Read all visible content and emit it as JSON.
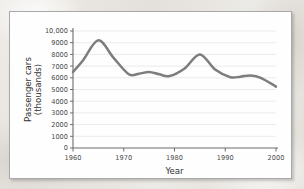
{
  "chart_data": {
    "type": "line",
    "title": "",
    "xlabel": "Year",
    "ylabel": "Passenger cars (thousands)",
    "ylabel_line1": "Passenger cars",
    "ylabel_line2": "(thousands)",
    "xlim": [
      1960,
      2000
    ],
    "ylim": [
      0,
      10000
    ],
    "grid": true,
    "legend": "none",
    "xticks": [
      1960,
      1970,
      1980,
      1990,
      2000
    ],
    "xtick_labels": [
      "1960",
      "1970",
      "1980",
      "1990",
      "2000"
    ],
    "yticks": [
      0,
      1000,
      2000,
      3000,
      4000,
      5000,
      6000,
      7000,
      8000,
      9000,
      10000
    ],
    "ytick_labels": [
      "0",
      "1000",
      "2000",
      "3000",
      "4000",
      "5000",
      "6000",
      "7000",
      "8000",
      "9000",
      "10,000"
    ],
    "series": [
      {
        "name": "Passenger cars",
        "color": "#7d7d7d",
        "x": [
          1960,
          1962,
          1965,
          1968,
          1971,
          1973,
          1975,
          1977,
          1979,
          1982,
          1985,
          1988,
          1991,
          1993,
          1995,
          1997,
          2000
        ],
        "values": [
          6500,
          7500,
          9200,
          7700,
          6300,
          6350,
          6500,
          6300,
          6150,
          6800,
          8000,
          6700,
          6050,
          6100,
          6200,
          6000,
          5250
        ]
      }
    ]
  },
  "figure": {
    "curve_color": "#7d7d7d",
    "grid_color": "#e3e3e3",
    "axis_color": "#6b6b6b",
    "card_background": "#fefefe",
    "page_background": "#e9e6e2"
  }
}
